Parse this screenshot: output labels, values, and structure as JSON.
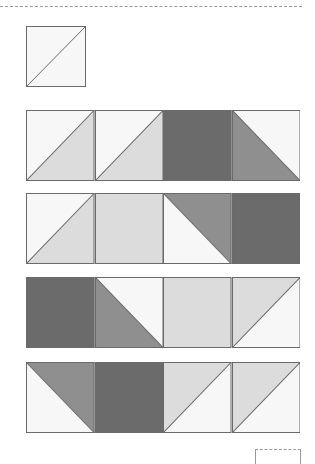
{
  "colors": {
    "white": "#f7f7f7",
    "light": "#dcdcdc",
    "medium": "#8f8f8f",
    "dark": "#6b6b6b",
    "line": "#6a6a6a"
  },
  "sample_block": {
    "type": "half-square",
    "diagonal": "bl-tr",
    "top": "white",
    "bottom": "white"
  },
  "rows": [
    [
      {
        "type": "half",
        "diag": "up",
        "a": "white",
        "b": "light"
      },
      {
        "type": "half",
        "diag": "up",
        "a": "white",
        "b": "light"
      },
      {
        "type": "solid",
        "fill": "dark"
      },
      {
        "type": "half",
        "diag": "down",
        "a": "white",
        "b": "medium"
      }
    ],
    [
      {
        "type": "half",
        "diag": "up",
        "a": "white",
        "b": "light"
      },
      {
        "type": "solid",
        "fill": "light"
      },
      {
        "type": "half",
        "diag": "down",
        "a": "medium",
        "b": "white"
      },
      {
        "type": "solid",
        "fill": "dark"
      }
    ],
    [
      {
        "type": "solid",
        "fill": "dark"
      },
      {
        "type": "half",
        "diag": "down",
        "a": "white",
        "b": "medium"
      },
      {
        "type": "solid",
        "fill": "light"
      },
      {
        "type": "half",
        "diag": "up",
        "a": "light",
        "b": "white"
      }
    ],
    [
      {
        "type": "half",
        "diag": "down",
        "a": "medium",
        "b": "white"
      },
      {
        "type": "solid",
        "fill": "dark"
      },
      {
        "type": "half",
        "diag": "up",
        "a": "light",
        "b": "white"
      },
      {
        "type": "half",
        "diag": "up",
        "a": "light",
        "b": "white"
      }
    ]
  ]
}
